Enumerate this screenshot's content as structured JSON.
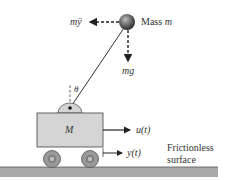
{
  "diagram": {
    "labels": {
      "inertial_force": "mÿ",
      "mass": "Mass ",
      "mass_var": "m",
      "gravity": "mg",
      "angle": "θ",
      "cart": "M",
      "input": "u(t)",
      "position": "y(t)",
      "surface_line1": "Frictionless",
      "surface_line2": "surface"
    },
    "colors": {
      "cart_fill": "#d4d4d4",
      "cart_stroke": "#555555",
      "ground": "#a8a8a8",
      "wheel_outer": "#9a9a9a",
      "wheel_inner": "#c0c0c0",
      "ball": "#555555",
      "line": "#333333"
    }
  }
}
